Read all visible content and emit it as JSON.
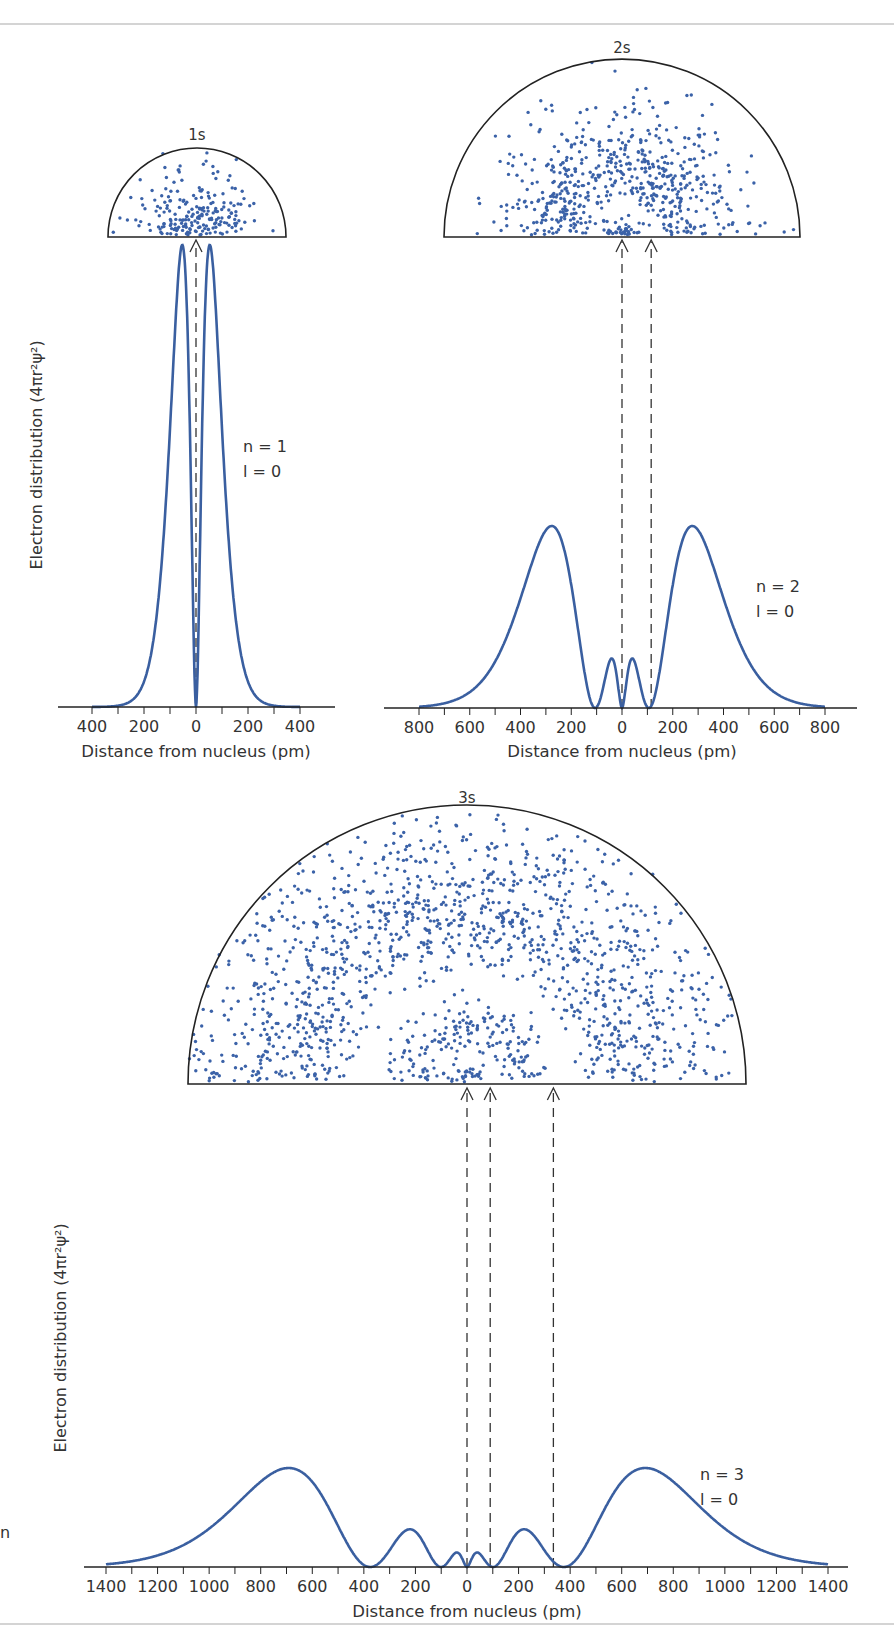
{
  "figure": {
    "colors": {
      "curve": "#3a5fa0",
      "dot": "#3b62a8",
      "outline": "#222222",
      "axis": "#222222",
      "dashed": "#333333",
      "rule": "#d4d4d4"
    },
    "edge_fragment": "n"
  },
  "chart_data": [
    {
      "id": "1s",
      "type": "line",
      "title": "1s",
      "xlabel": "Distance from nucleus (pm)",
      "ylabel": "Electron distribution (4πr²ψ²)",
      "annotation": [
        "n = 1",
        "l = 0"
      ],
      "xlim": [
        -500,
        500
      ],
      "tick_step": 100,
      "tick_labels": [
        "400",
        "200",
        "0",
        "200",
        "400"
      ],
      "tick_label_values": [
        -400,
        -200,
        0,
        200,
        400
      ],
      "nodes_pm": [
        0
      ],
      "peaks_pm": [
        -53,
        53
      ],
      "peak_heights_relative": [
        1.0,
        1.0
      ],
      "grid": false,
      "n": 1
    },
    {
      "id": "2s",
      "type": "line",
      "title": "2s",
      "xlabel": "Distance from nucleus (pm)",
      "ylabel": "",
      "annotation": [
        "n = 2",
        "l = 0"
      ],
      "xlim": [
        -900,
        900
      ],
      "tick_step": 100,
      "tick_labels": [
        "800",
        "600",
        "400",
        "200",
        "0",
        "200",
        "400",
        "600",
        "800"
      ],
      "tick_label_values": [
        -800,
        -600,
        -400,
        -200,
        0,
        200,
        400,
        600,
        800
      ],
      "nodes_pm": [
        -106,
        0,
        106
      ],
      "peaks_pm": [
        -280,
        -40,
        40,
        280
      ],
      "peak_heights_relative": [
        1.0,
        0.2,
        0.2,
        1.0
      ],
      "grid": false,
      "n": 2
    },
    {
      "id": "3s",
      "type": "line",
      "title": "3s",
      "xlabel": "Distance from nucleus (pm)",
      "ylabel": "Electron distribution (4πr²ψ²)",
      "annotation": [
        "n = 3",
        "l = 0"
      ],
      "xlim": [
        -1480,
        1480
      ],
      "tick_step": 100,
      "tick_labels": [
        "1400",
        "1200",
        "1000",
        "800",
        "600",
        "400",
        "200",
        "0",
        "200",
        "400",
        "600",
        "800",
        "1000",
        "1200",
        "1400"
      ],
      "tick_label_values": [
        -1400,
        -1200,
        -1000,
        -800,
        -600,
        -400,
        -200,
        0,
        200,
        400,
        600,
        800,
        1000,
        1200,
        1400
      ],
      "nodes_pm": [
        -370,
        -100,
        0,
        100,
        370
      ],
      "peaks_pm": [
        -690,
        -210,
        -40,
        40,
        210,
        690
      ],
      "peak_heights_relative": [
        1.0,
        0.27,
        0.1,
        0.1,
        0.27,
        1.0
      ],
      "grid": false,
      "n": 3
    }
  ]
}
